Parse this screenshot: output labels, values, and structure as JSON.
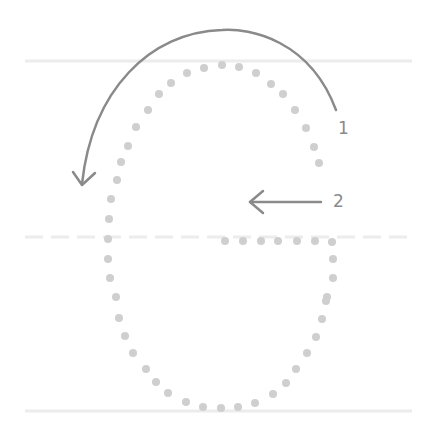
{
  "diagram": {
    "colors": {
      "guide_line": "#ececec",
      "dot": "#cfcfcf",
      "stroke_arrow": "#8a8a8a",
      "label": "#8a8a8a"
    },
    "guides": {
      "top_y": 61,
      "middle_y": 237,
      "bottom_y": 411,
      "x_start": 25,
      "x_end": 412
    },
    "steps": [
      {
        "number": "1",
        "label_x": 338,
        "label_y": 120,
        "type": "curved-arrow"
      },
      {
        "number": "2",
        "label_x": 333,
        "label_y": 193,
        "type": "straight-arrow"
      }
    ],
    "dots": [
      [
        222,
        65
      ],
      [
        239,
        67
      ],
      [
        256,
        73
      ],
      [
        271,
        84
      ],
      [
        283,
        94
      ],
      [
        295,
        110
      ],
      [
        306,
        128
      ],
      [
        314,
        147
      ],
      [
        319,
        163
      ],
      [
        204,
        68
      ],
      [
        187,
        73
      ],
      [
        171,
        83
      ],
      [
        159,
        94
      ],
      [
        148,
        110
      ],
      [
        136,
        127
      ],
      [
        128,
        146
      ],
      [
        121,
        162
      ],
      [
        117,
        180
      ],
      [
        111,
        199
      ],
      [
        109,
        219
      ],
      [
        108,
        239
      ],
      [
        108,
        259
      ],
      [
        110,
        278
      ],
      [
        116,
        297
      ],
      [
        119,
        318
      ],
      [
        125,
        336
      ],
      [
        133,
        353
      ],
      [
        146,
        369
      ],
      [
        156,
        382
      ],
      [
        168,
        393
      ],
      [
        186,
        402
      ],
      [
        203,
        407
      ],
      [
        221,
        408
      ],
      [
        238,
        407
      ],
      [
        255,
        403
      ],
      [
        273,
        394
      ],
      [
        286,
        383
      ],
      [
        296,
        369
      ],
      [
        307,
        353
      ],
      [
        316,
        337
      ],
      [
        322,
        319
      ],
      [
        326,
        301
      ],
      [
        327,
        297
      ],
      [
        333,
        278
      ],
      [
        333,
        259
      ],
      [
        332,
        242
      ],
      [
        225,
        241
      ],
      [
        243,
        241
      ],
      [
        261,
        241
      ],
      [
        278,
        241
      ],
      [
        297,
        241
      ],
      [
        315,
        241
      ]
    ]
  }
}
